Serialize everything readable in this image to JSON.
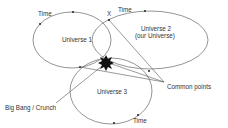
{
  "diagram": {
    "universes": [
      {
        "label": "Universe 1"
      },
      {
        "label": "Universe 2",
        "sublabel": "(our Universe)"
      },
      {
        "label": "Universe 3"
      }
    ],
    "time_labels": [
      "Time",
      "Time",
      "Time"
    ],
    "intersection_label": "X",
    "big_bang_label": "Big Bang / Crunch",
    "common_points_label": "Common points",
    "colors": {
      "line": "#555555",
      "text": "#333333",
      "burst": "#111111"
    }
  }
}
